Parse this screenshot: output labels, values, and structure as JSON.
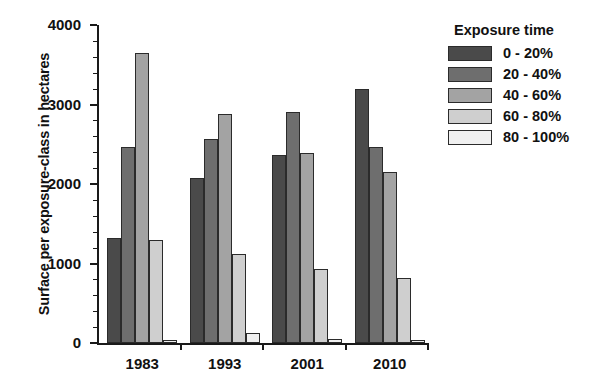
{
  "chart_data": {
    "type": "bar",
    "title": "",
    "xlabel": "",
    "ylabel": "Surface per exposure-class in hectares",
    "categories": [
      "1983",
      "1993",
      "2001",
      "2010"
    ],
    "ylim": [
      0,
      4000
    ],
    "yticks": [
      0,
      1000,
      2000,
      3000,
      4000
    ],
    "ytick_labels": [
      "0",
      "1000",
      "2000",
      "3000",
      "4000"
    ],
    "grid": false,
    "legend_position": "right",
    "legend_title": "Exposure time",
    "series": [
      {
        "name": "0 - 20%",
        "color": "#4a4a4a",
        "values": [
          1320,
          2070,
          2360,
          3200
        ]
      },
      {
        "name": "20 - 40%",
        "color": "#6e6e6e",
        "values": [
          2460,
          2560,
          2900,
          2470
        ]
      },
      {
        "name": "40 - 60%",
        "color": "#a3a3a3",
        "values": [
          3650,
          2880,
          2390,
          2150
        ]
      },
      {
        "name": "60 - 80%",
        "color": "#cfcfcf",
        "values": [
          1300,
          1120,
          930,
          820
        ]
      },
      {
        "name": "80 - 100%",
        "color": "#f0f0f0",
        "values": [
          40,
          130,
          55,
          40
        ]
      }
    ]
  }
}
